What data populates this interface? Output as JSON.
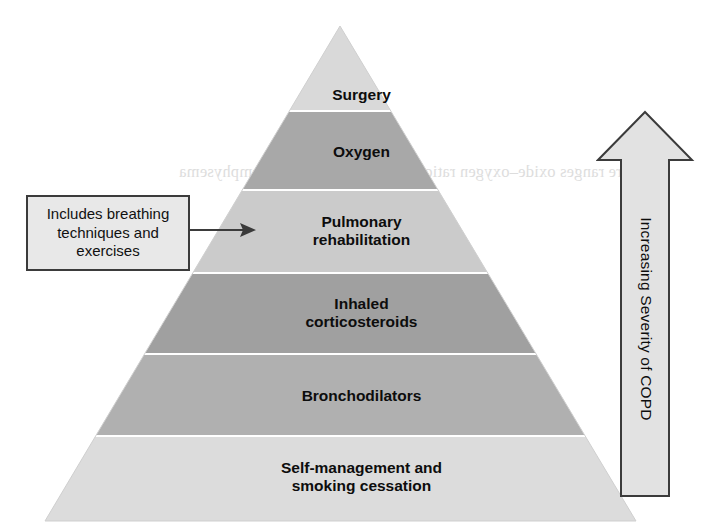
{
  "figure": {
    "kind": "treatment-pyramid",
    "background_color": "#ffffff"
  },
  "ghost": {
    "bleed_through_text": "Pressure ranges oxide–oxygen ratio during respiration with emphysema"
  },
  "pyramid": {
    "apex": {
      "x": 340,
      "y": 26
    },
    "base": {
      "left_x": 45,
      "right_x": 636,
      "y": 521
    },
    "outline_color": "#cfcfcf",
    "divider_color": "#ffffff",
    "layers": [
      {
        "id": "surgery",
        "label": "Surgery",
        "fill": "#d9d9d9",
        "top_y": 26,
        "bottom_y": 110,
        "label_y": 86,
        "font_size": 15.5
      },
      {
        "id": "oxygen",
        "label": "Oxygen",
        "fill": "#a8a8a8",
        "top_y": 112,
        "bottom_y": 189,
        "label_y": 143,
        "font_size": 15.5
      },
      {
        "id": "pulmonary-rehabilitation",
        "label": "Pulmonary\nrehabilitation",
        "fill": "#cbcbcb",
        "top_y": 191,
        "bottom_y": 272,
        "label_y": 213,
        "font_size": 15.5
      },
      {
        "id": "inhaled-corticosteroids",
        "label": "Inhaled\ncorticosteroids",
        "fill": "#a0a0a0",
        "top_y": 274,
        "bottom_y": 353,
        "label_y": 295,
        "font_size": 15.5
      },
      {
        "id": "bronchodilators",
        "label": "Bronchodilators",
        "fill": "#b0b0b0",
        "top_y": 355,
        "bottom_y": 435,
        "label_y": 387,
        "font_size": 15.5
      },
      {
        "id": "self-management-smoking-cessation",
        "label": "Self-management and\nsmoking cessation",
        "fill": "#dcdcdc",
        "top_y": 437,
        "bottom_y": 521,
        "label_y": 459,
        "font_size": 15.5
      }
    ]
  },
  "callout": {
    "text": "Includes breathing\ntechniques and\nexercises",
    "fill": "#e8e8e8",
    "border_color": "#3b3b3b",
    "points_to": "pulmonary-rehabilitation"
  },
  "severity_arrow": {
    "label": "Increasing Severity of COPD",
    "direction": "up",
    "fill": "#e2e2e2",
    "stroke": "#3b3b3b"
  }
}
